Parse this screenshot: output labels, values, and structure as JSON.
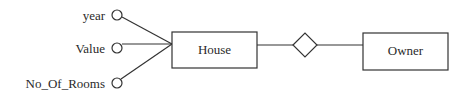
{
  "diagram": {
    "type": "er-diagram",
    "stroke_color": "#333333",
    "attributes": [
      {
        "label": "year",
        "cx": 117,
        "cy": 15
      },
      {
        "label": "Value",
        "cx": 117,
        "cy": 48
      },
      {
        "label": "No_Of_Rooms",
        "cx": 117,
        "cy": 82
      }
    ],
    "entities": [
      {
        "label": "House",
        "x": 172,
        "y": 32,
        "w": 85,
        "h": 36
      },
      {
        "label": "Owner",
        "x": 363,
        "y": 33,
        "w": 85,
        "h": 37
      }
    ],
    "relationships": [
      {
        "label": "",
        "cx": 305,
        "cy": 45,
        "rx": 12,
        "ry": 12
      }
    ]
  }
}
